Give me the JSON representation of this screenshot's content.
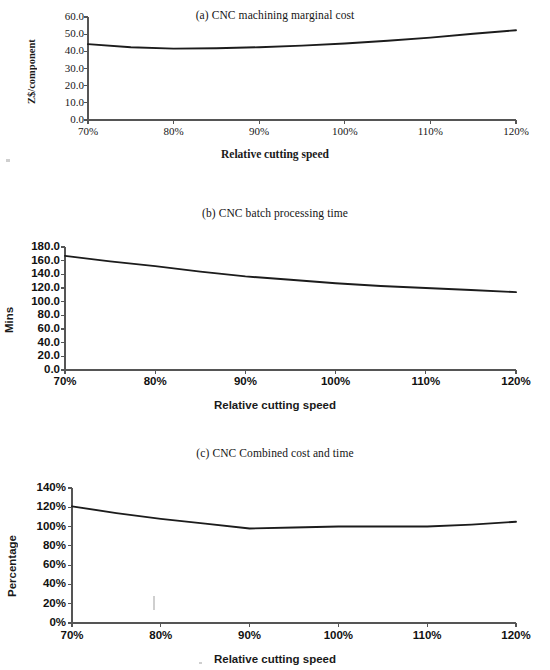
{
  "figure": {
    "background_color": "#ffffff",
    "line_color": "#1c1c1c",
    "axis_color": "#555555"
  },
  "chart_data": [
    {
      "type": "line",
      "panel": "a",
      "title": "(a) CNC machining marginal cost",
      "xlabel": "Relative cutting speed",
      "ylabel": "Z$/component",
      "xticklabels": [
        "70%",
        "80%",
        "90%",
        "100%",
        "110%",
        "120%"
      ],
      "x": [
        70,
        80,
        90,
        100,
        110,
        120
      ],
      "yticklabels": [
        "0.0",
        "10.0",
        "20.0",
        "30.0",
        "40.0",
        "50.0",
        "60.0"
      ],
      "yticks": [
        0,
        10,
        20,
        30,
        40,
        50,
        60
      ],
      "ylim": [
        0,
        60
      ],
      "xlim": [
        70,
        120
      ],
      "grid": false,
      "legend": "none",
      "series": [
        {
          "name": "Marginal cost",
          "x": [
            70,
            75,
            80,
            85,
            90,
            95,
            100,
            105,
            110,
            115,
            120
          ],
          "values": [
            44.2,
            42.4,
            41.6,
            41.8,
            42.4,
            43.3,
            44.6,
            46.2,
            48.0,
            50.2,
            52.3
          ]
        }
      ]
    },
    {
      "type": "line",
      "panel": "b",
      "title": "(b) CNC batch processing time",
      "xlabel": "Relative cutting speed",
      "ylabel": "Mins",
      "xticklabels": [
        "70%",
        "80%",
        "90%",
        "100%",
        "110%",
        "120%"
      ],
      "x": [
        70,
        80,
        90,
        100,
        110,
        120
      ],
      "yticklabels": [
        "0.0",
        "20.0",
        "40.0",
        "60.0",
        "80.0",
        "100.0",
        "120.0",
        "140.0",
        "160.0",
        "180.0"
      ],
      "yticks": [
        0,
        20,
        40,
        60,
        80,
        100,
        120,
        140,
        160,
        180
      ],
      "ylim": [
        0,
        180
      ],
      "xlim": [
        70,
        120
      ],
      "grid": false,
      "legend": "none",
      "series": [
        {
          "name": "Batch processing time",
          "x": [
            70,
            75,
            80,
            85,
            90,
            95,
            100,
            105,
            110,
            115,
            120
          ],
          "values": [
            167.0,
            159.0,
            152.0,
            144.0,
            137.0,
            132.0,
            127.0,
            123.0,
            120.0,
            117.0,
            114.0
          ]
        }
      ]
    },
    {
      "type": "line",
      "panel": "c",
      "title": "(c) CNC Combined cost and time",
      "xlabel": "Relative cutting speed",
      "ylabel": "Percentage",
      "xticklabels": [
        "70%",
        "80%",
        "90%",
        "100%",
        "110%",
        "120%"
      ],
      "x": [
        70,
        80,
        90,
        100,
        110,
        120
      ],
      "yticklabels": [
        "0%",
        "20%",
        "40%",
        "60%",
        "80%",
        "100%",
        "120%",
        "140%"
      ],
      "yticks": [
        0,
        20,
        40,
        60,
        80,
        100,
        120,
        140
      ],
      "ylim": [
        0,
        140
      ],
      "xlim": [
        70,
        120
      ],
      "grid": false,
      "legend": "none",
      "series": [
        {
          "name": "Combined cost and time",
          "x": [
            70,
            75,
            80,
            85,
            90,
            95,
            100,
            105,
            110,
            115,
            120
          ],
          "values": [
            121,
            114,
            108,
            103,
            98,
            99,
            100,
            100,
            100,
            102,
            105
          ]
        }
      ]
    }
  ]
}
